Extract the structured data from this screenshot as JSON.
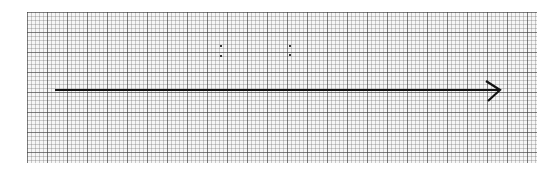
{
  "diagram": {
    "type": "number-line-arrow",
    "grid": {
      "minor_spacing_px": 4,
      "major_spacing_px": 20
    },
    "arrow": {
      "x_start": 55,
      "x_end": 500,
      "y": 90,
      "color": "#111111",
      "direction": "right"
    }
  }
}
